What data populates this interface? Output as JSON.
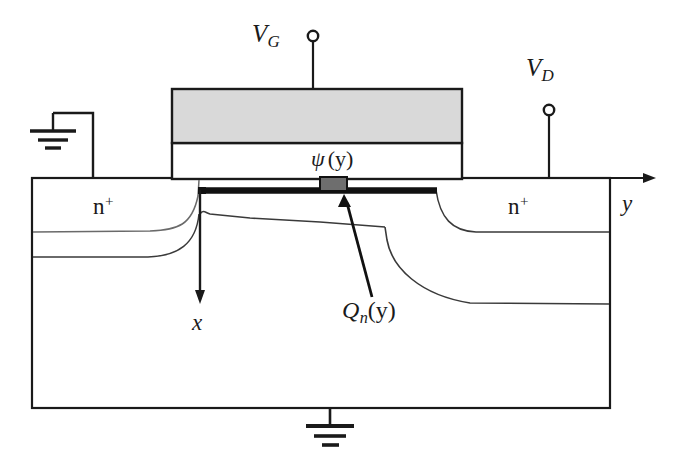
{
  "figure": {
    "type": "device-cross-section-diagram"
  },
  "colors": {
    "line": "#1a1a1a",
    "gate_fill": "#d9d9d9",
    "oxide_fill": "#ffffff",
    "channel_fill": "#6e6e6e",
    "inversion_layer": "#111111",
    "junction_curve": "#4a4a4a",
    "background": "#ffffff"
  },
  "labels": {
    "gate_terminal": {
      "symbol": "V",
      "subscript": "G"
    },
    "drain_terminal": {
      "symbol": "V",
      "subscript": "D"
    },
    "surface_potential": {
      "symbol": "ψ",
      "arg": "(y)"
    },
    "inversion_charge": {
      "symbol": "Q",
      "subscript": "n",
      "arg": "(y)"
    },
    "source_region": {
      "symbol": "n",
      "superscript": "+"
    },
    "drain_region": {
      "symbol": "n",
      "superscript": "+"
    },
    "axis_y": "y",
    "axis_x": "x"
  },
  "regions": [
    {
      "name": "gate-electrode",
      "fill": "gate_fill",
      "description": "polysilicon gate"
    },
    {
      "name": "gate-oxide",
      "fill": "oxide_fill",
      "description": "gate oxide"
    },
    {
      "name": "substrate",
      "fill": "oxide_fill",
      "description": "p-type silicon body"
    },
    {
      "name": "source-diffusion",
      "fill": "oxide_fill",
      "description": "n-plus source"
    },
    {
      "name": "drain-diffusion",
      "fill": "oxide_fill",
      "description": "n-plus drain"
    },
    {
      "name": "inversion-channel",
      "fill": "inversion_layer",
      "description": "inversion layer"
    },
    {
      "name": "surface-potential-element",
      "fill": "channel_fill",
      "description": "shaded channel element"
    }
  ],
  "terminals": [
    {
      "name": "gate-terminal",
      "label_key": "gate_terminal",
      "grounded": false
    },
    {
      "name": "drain-terminal",
      "label_key": "drain_terminal",
      "grounded": false
    },
    {
      "name": "source-terminal",
      "label_key": null,
      "grounded": true
    },
    {
      "name": "body-terminal",
      "label_key": null,
      "grounded": true
    }
  ],
  "axes": {
    "y_axis": {
      "label": "y",
      "direction": "right",
      "origin": "top-right of substrate"
    },
    "x_axis": {
      "label": "x",
      "direction": "down",
      "origin": "source-channel edge at surface"
    }
  }
}
